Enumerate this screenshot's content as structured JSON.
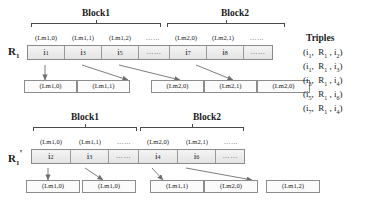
{
  "figure": {
    "top_row": {
      "label_base": "R",
      "label_sub": "1",
      "label_prime": "",
      "blocks": [
        {
          "title": "Block1"
        },
        {
          "title": "Block2"
        }
      ],
      "addresses": [
        "(Lm1,0)",
        "(Lm1,1)",
        "(Lm1,2)",
        "……",
        "(Lm2,0)",
        "(Lm2,1)",
        "……"
      ],
      "cells": [
        {
          "base": "i",
          "sub": "1"
        },
        {
          "base": "i",
          "sub": "3"
        },
        {
          "base": "i",
          "sub": "5"
        },
        {
          "base": "……",
          "sub": ""
        },
        {
          "base": "i",
          "sub": "7"
        },
        {
          "base": "i",
          "sub": "8"
        },
        {
          "base": "……",
          "sub": ""
        }
      ],
      "outputs": [
        "(Lm1,0)",
        "(Lm1,1)",
        "(Lm2,0)",
        "(Lm2,1)",
        "(Lm2,0)"
      ]
    },
    "bottom_row": {
      "label_base": "R",
      "label_sub": "1",
      "label_prime": "'",
      "blocks": [
        {
          "title": "Block1"
        },
        {
          "title": "Block2"
        }
      ],
      "addresses": [
        "(Lm1,0)",
        "(Lm1,1)",
        "……",
        "(Lm2,0)",
        "(Lm2,1)",
        "……"
      ],
      "cells": [
        {
          "base": "i",
          "sub": "2"
        },
        {
          "base": "i",
          "sub": "3"
        },
        {
          "base": "……",
          "sub": ""
        },
        {
          "base": "i",
          "sub": "4"
        },
        {
          "base": "i",
          "sub": "6"
        },
        {
          "base": "……",
          "sub": ""
        }
      ],
      "outputs": [
        "(Lm1,0)",
        "(Lm1,0)",
        "(Lm1,1)",
        "(Lm2,0)",
        "(Lm1,2)"
      ]
    },
    "triples": {
      "title": "Triples",
      "rows": [
        {
          "subject": "i",
          "subject_sub": "1",
          "predicate": "R",
          "predicate_sub": "1",
          "object": "i",
          "object_sub": "2"
        },
        {
          "subject": "i",
          "subject_sub": "1",
          "predicate": "R",
          "predicate_sub": "1",
          "object": "i",
          "object_sub": "3"
        },
        {
          "subject": "i",
          "subject_sub": "3",
          "predicate": "R",
          "predicate_sub": "1",
          "object": "i",
          "object_sub": "4"
        },
        {
          "subject": "i",
          "subject_sub": "5",
          "predicate": "R",
          "predicate_sub": "1",
          "object": "i",
          "object_sub": "6"
        },
        {
          "subject": "i",
          "subject_sub": "7",
          "predicate": "R",
          "predicate_sub": "1",
          "object": "i",
          "object_sub": "4"
        }
      ]
    },
    "colors": {
      "strip_fill": "#ededed",
      "strip_border": "#8a8a8a",
      "box_border": "#8d8d8d",
      "arrow": "#6e6e6e",
      "text": "#1a1a1a"
    }
  }
}
